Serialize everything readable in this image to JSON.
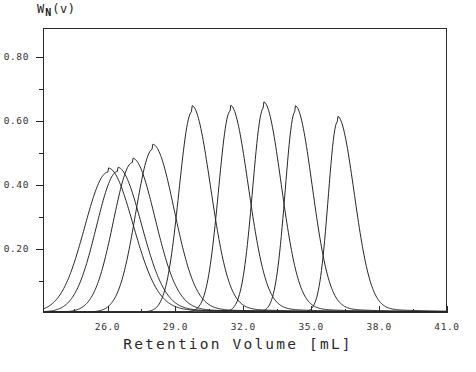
{
  "chart_data": {
    "type": "line",
    "title": "",
    "xlabel": "Retention Volume  [mL]",
    "ylabel": "W_N(v)",
    "ylabel_main": "W",
    "ylabel_sub": "N",
    "ylabel_tail": "(v)",
    "xlim": [
      23.15,
      41.0
    ],
    "ylim": [
      0.0,
      0.89
    ],
    "grid": false,
    "legend": "none",
    "xticks": [
      26.0,
      29.0,
      32.0,
      35.0,
      38.0,
      41.0
    ],
    "xtick_labels": [
      "26.0",
      "29.0",
      "32.0",
      "35.0",
      "38.0",
      "41.0"
    ],
    "xticks_minor": [
      24.5,
      27.5,
      30.5,
      33.5,
      36.5,
      39.5
    ],
    "yticks": [
      0.2,
      0.4,
      0.6,
      0.8
    ],
    "ytick_labels": [
      "0.20",
      "0.40",
      "0.60",
      "0.80"
    ],
    "yticks_minor": [
      0.1,
      0.3,
      0.5,
      0.7
    ],
    "series": [
      {
        "name": "peak-1",
        "peak_x": 26.0,
        "peak_y": 0.44,
        "width": 1.1,
        "skew": 0.95
      },
      {
        "name": "peak-2",
        "peak_x": 26.42,
        "peak_y": 0.442,
        "width": 1.05,
        "skew": 0.9
      },
      {
        "name": "peak-3",
        "peak_x": 27.08,
        "peak_y": 0.47,
        "width": 1.0,
        "skew": 0.85
      },
      {
        "name": "peak-4",
        "peak_x": 27.98,
        "peak_y": 0.512,
        "width": 0.95,
        "skew": 0.8
      },
      {
        "name": "peak-5",
        "peak_x": 29.72,
        "peak_y": 0.63,
        "width": 0.82,
        "skew": 0.7
      },
      {
        "name": "peak-6",
        "peak_x": 31.42,
        "peak_y": 0.632,
        "width": 0.8,
        "skew": 0.65
      },
      {
        "name": "peak-7",
        "peak_x": 32.9,
        "peak_y": 0.642,
        "width": 0.78,
        "skew": 0.62
      },
      {
        "name": "peak-8",
        "peak_x": 34.3,
        "peak_y": 0.63,
        "width": 0.76,
        "skew": 0.58
      },
      {
        "name": "peak-9",
        "peak_x": 36.18,
        "peak_y": 0.598,
        "width": 0.74,
        "skew": 0.55
      }
    ]
  }
}
